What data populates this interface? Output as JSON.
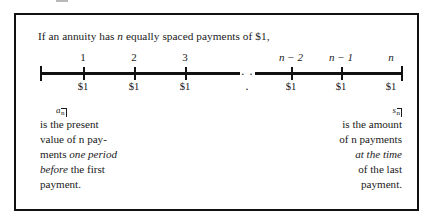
{
  "figure": {
    "intro": {
      "before_var": "If an annuity has ",
      "variable": "n",
      "after_var": " equally spaced payments of $1,"
    },
    "timeline": {
      "ellipsis": ". . .",
      "periods": [
        {
          "label": "1",
          "amount": "$1",
          "italic": false,
          "x": 67
        },
        {
          "label": "2",
          "amount": "$1",
          "italic": false,
          "x": 118
        },
        {
          "label": "3",
          "amount": "$1",
          "italic": false,
          "x": 169
        },
        {
          "label": "n − 2",
          "amount": "$1",
          "italic": true,
          "x": 275
        },
        {
          "label": "n − 1",
          "amount": "$1",
          "italic": true,
          "x": 325
        },
        {
          "label": "n",
          "amount": "$1",
          "italic": true,
          "x": 375
        }
      ]
    },
    "left_caption": {
      "symbol_base": "a",
      "symbol_sub": "n",
      "lines": [
        {
          "text": "is the present"
        },
        {
          "text": "value of n pay-"
        },
        {
          "text": "ments one period",
          "italic_from": "one period"
        },
        {
          "text": "before the first",
          "italic_from": "before"
        },
        {
          "text": "payment."
        }
      ]
    },
    "right_caption": {
      "symbol_base": "s",
      "symbol_sub": "n",
      "lines": [
        {
          "text": "is the amount"
        },
        {
          "text": "of n payments"
        },
        {
          "text": "at the time",
          "italic_from": "at the time"
        },
        {
          "text": "of the last"
        },
        {
          "text": "payment."
        }
      ]
    }
  },
  "colors": {
    "ink": "#111111",
    "paper": "#ffffff"
  }
}
